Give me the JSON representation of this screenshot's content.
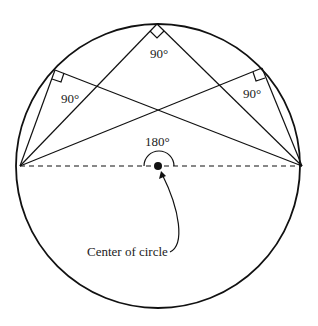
{
  "diagram": {
    "circle": {
      "cx": 158,
      "cy": 166,
      "r": 142
    },
    "diameter": {
      "x1": 20,
      "y1": 166,
      "x2": 302,
      "y2": 166,
      "style": "dashed"
    },
    "inscribed_vertices": [
      {
        "id": "top",
        "x": 157,
        "y": 24,
        "angle_label": "90°"
      },
      {
        "id": "left",
        "x": 55,
        "y": 70,
        "angle_label": "90°"
      },
      {
        "id": "right",
        "x": 262,
        "y": 68,
        "angle_label": "90°"
      }
    ],
    "central_angle_label": "180°",
    "center_label": "Center of circle",
    "colors": {
      "stroke": "#111111",
      "background": "#ffffff"
    }
  }
}
